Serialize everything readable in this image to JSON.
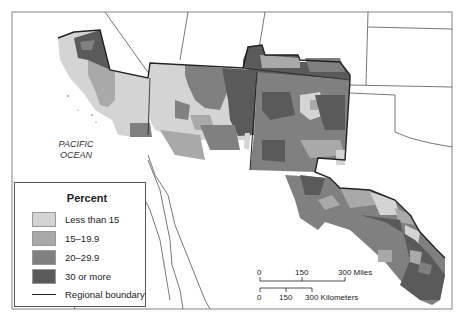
{
  "map": {
    "ocean_label_line1": "PACIFIC",
    "ocean_label_line2": "OCEAN",
    "colors": {
      "less_than_15": "#d4d4d4",
      "15_19_9": "#a9a9a9",
      "20_29_9": "#808080",
      "30_or_more": "#5a5a5a",
      "boundary": "#222222",
      "background": "#ffffff",
      "state_line": "#555555"
    }
  },
  "legend": {
    "title": "Percent",
    "items": [
      {
        "label": "Less than 15",
        "color": "#d4d4d4"
      },
      {
        "label": "15–19.9",
        "color": "#a9a9a9"
      },
      {
        "label": "20–29.9",
        "color": "#808080"
      },
      {
        "label": "30 or more",
        "color": "#5a5a5a"
      }
    ],
    "boundary_label": "Regional boundary"
  },
  "scale": {
    "miles": {
      "ticks": [
        "0",
        "150",
        "300 Miles"
      ]
    },
    "km": {
      "ticks": [
        "0",
        "150",
        "300 Kilometers"
      ]
    }
  }
}
